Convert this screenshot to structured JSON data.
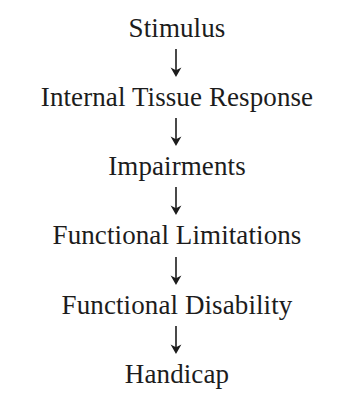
{
  "diagram": {
    "type": "linear-flow",
    "orientation": "vertical",
    "text_color": "#1c1c1c",
    "background_color": "#ffffff",
    "nodes": [
      {
        "id": "stimulus",
        "label": "Stimulus"
      },
      {
        "id": "internal-tissue-response",
        "label": "Internal Tissue Response"
      },
      {
        "id": "impairments",
        "label": "Impairments"
      },
      {
        "id": "functional-limitations",
        "label": "Functional Limitations"
      },
      {
        "id": "functional-disability",
        "label": "Functional Disability"
      },
      {
        "id": "handicap",
        "label": "Handicap"
      }
    ],
    "connectors": [
      {
        "id": "arrow-1",
        "icon": "arrow-down-icon",
        "from": "stimulus",
        "to": "internal-tissue-response"
      },
      {
        "id": "arrow-2",
        "icon": "arrow-down-icon",
        "from": "internal-tissue-response",
        "to": "impairments"
      },
      {
        "id": "arrow-3",
        "icon": "arrow-down-icon",
        "from": "impairments",
        "to": "functional-limitations"
      },
      {
        "id": "arrow-4",
        "icon": "arrow-down-icon",
        "from": "functional-limitations",
        "to": "functional-disability"
      },
      {
        "id": "arrow-5",
        "icon": "arrow-down-icon",
        "from": "functional-disability",
        "to": "handicap"
      }
    ]
  }
}
